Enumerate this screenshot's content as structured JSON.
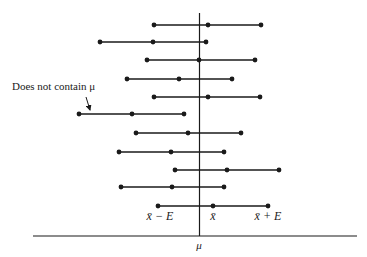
{
  "diagram": {
    "type": "confidence-intervals",
    "mean_line": {
      "x": 199.5,
      "y_top": 13,
      "y_bottom": 236,
      "label": "μ",
      "label_x": 199,
      "label_y": 249
    },
    "axis": {
      "y": 236,
      "x_start": 33,
      "x_end": 357
    },
    "intervals": [
      {
        "y": 25,
        "lower": 154,
        "center": 208,
        "upper": 261,
        "contains_mu": true
      },
      {
        "y": 42,
        "lower": 100,
        "center": 153,
        "upper": 206,
        "contains_mu": true
      },
      {
        "y": 60,
        "lower": 147,
        "center": 199,
        "upper": 255,
        "contains_mu": true
      },
      {
        "y": 79,
        "lower": 127,
        "center": 179,
        "upper": 232,
        "contains_mu": true
      },
      {
        "y": 97,
        "lower": 154,
        "center": 208,
        "upper": 260,
        "contains_mu": true
      },
      {
        "y": 114,
        "lower": 79,
        "center": 132,
        "upper": 184,
        "contains_mu": false
      },
      {
        "y": 133,
        "lower": 136,
        "center": 188,
        "upper": 241,
        "contains_mu": true
      },
      {
        "y": 152,
        "lower": 119,
        "center": 171,
        "upper": 224,
        "contains_mu": true
      },
      {
        "y": 170,
        "lower": 175,
        "center": 227,
        "upper": 279,
        "contains_mu": true
      },
      {
        "y": 187,
        "lower": 121,
        "center": 172,
        "upper": 224,
        "contains_mu": true
      },
      {
        "y": 206,
        "lower": 158,
        "center": 213,
        "upper": 268,
        "contains_mu": true
      }
    ],
    "endpoint_labels": {
      "lower": "x̄ − E",
      "center": "x̄",
      "upper": "x̄ + E",
      "y": 220
    },
    "annotation": {
      "text": "Does not contain μ",
      "x": 12,
      "y": 90,
      "arrow": {
        "x1": 86,
        "y1": 97,
        "x2": 90,
        "y2": 110
      }
    },
    "colors": {
      "line": "#1a1a1a",
      "background": "#ffffff"
    }
  }
}
